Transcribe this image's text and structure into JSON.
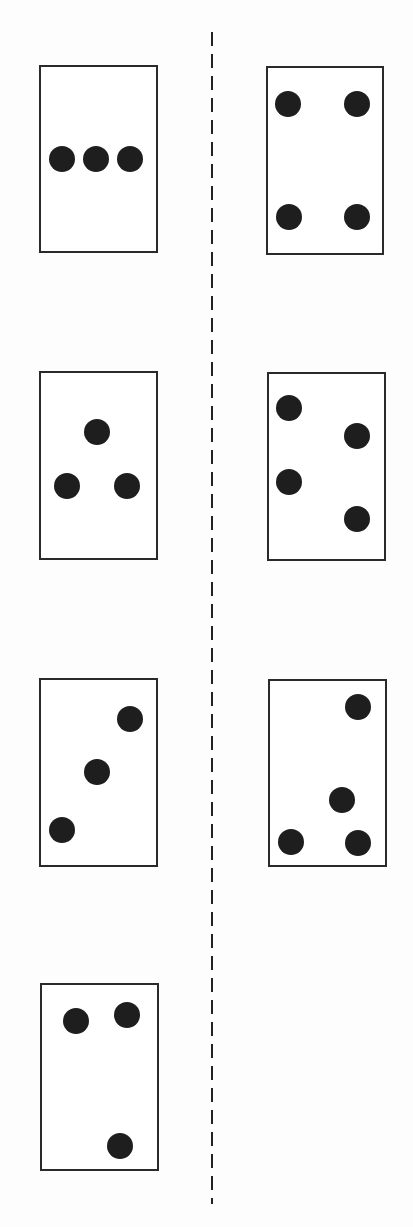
{
  "divider": {
    "x": 212,
    "y1": 32,
    "y2": 1204,
    "dash": "14 8",
    "color": "#222222"
  },
  "dot_radius": 13,
  "dot_color": "#1e1e1e",
  "card_stroke": "#2a2a2a",
  "cards": [
    {
      "id": "card-1",
      "side": "left",
      "x": 40,
      "y": 66,
      "w": 117,
      "h": 186,
      "dots": [
        [
          62,
          159
        ],
        [
          96,
          159
        ],
        [
          130,
          159
        ]
      ]
    },
    {
      "id": "card-2",
      "side": "right",
      "x": 267,
      "y": 67,
      "w": 116,
      "h": 187,
      "dots": [
        [
          288,
          104
        ],
        [
          357,
          104
        ],
        [
          289,
          217
        ],
        [
          357,
          217
        ]
      ]
    },
    {
      "id": "card-3",
      "side": "left",
      "x": 40,
      "y": 372,
      "w": 117,
      "h": 187,
      "dots": [
        [
          97,
          432
        ],
        [
          67,
          486
        ],
        [
          127,
          486
        ]
      ]
    },
    {
      "id": "card-4",
      "side": "right",
      "x": 268,
      "y": 373,
      "w": 117,
      "h": 187,
      "dots": [
        [
          289,
          408
        ],
        [
          357,
          436
        ],
        [
          289,
          482
        ],
        [
          357,
          519
        ]
      ]
    },
    {
      "id": "card-5",
      "side": "left",
      "x": 40,
      "y": 679,
      "w": 117,
      "h": 187,
      "dots": [
        [
          130,
          719
        ],
        [
          97,
          772
        ],
        [
          62,
          830
        ]
      ]
    },
    {
      "id": "card-6",
      "side": "right",
      "x": 269,
      "y": 680,
      "w": 117,
      "h": 186,
      "dots": [
        [
          358,
          707
        ],
        [
          342,
          800
        ],
        [
          291,
          842
        ],
        [
          358,
          843
        ]
      ]
    },
    {
      "id": "card-7",
      "side": "left",
      "x": 41,
      "y": 984,
      "w": 117,
      "h": 186,
      "dots": [
        [
          76,
          1021
        ],
        [
          127,
          1015
        ],
        [
          120,
          1146
        ]
      ]
    }
  ]
}
